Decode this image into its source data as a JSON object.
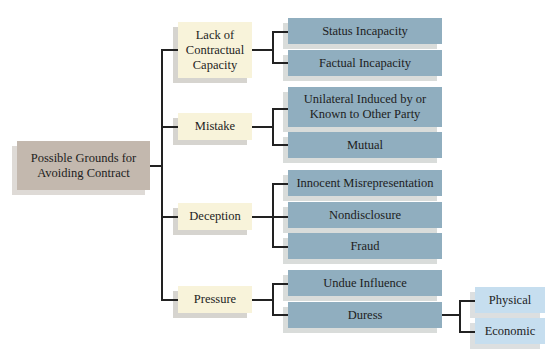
{
  "diagram": {
    "type": "tree",
    "root": {
      "label": "Possible Grounds for Avoiding Contract"
    },
    "branches": [
      {
        "label": "Lack of Contractual Capacity",
        "children": [
          {
            "label": "Status Incapacity"
          },
          {
            "label": "Factual Incapacity"
          }
        ]
      },
      {
        "label": "Mistake",
        "children": [
          {
            "label": "Unilateral Induced by or Known to Other Party"
          },
          {
            "label": "Mutual"
          }
        ]
      },
      {
        "label": "Deception",
        "children": [
          {
            "label": "Innocent Misrepresentation"
          },
          {
            "label": "Nondisclosure"
          },
          {
            "label": "Fraud"
          }
        ]
      },
      {
        "label": "Pressure",
        "children": [
          {
            "label": "Undue Influence"
          },
          {
            "label": "Duress",
            "children": [
              {
                "label": "Physical"
              },
              {
                "label": "Economic"
              }
            ]
          }
        ]
      }
    ]
  },
  "colors": {
    "root": "#c3b8ae",
    "level1": "#f8f3da",
    "level2": "#90aebf",
    "level3": "#c6deef",
    "connector": "#222222"
  }
}
